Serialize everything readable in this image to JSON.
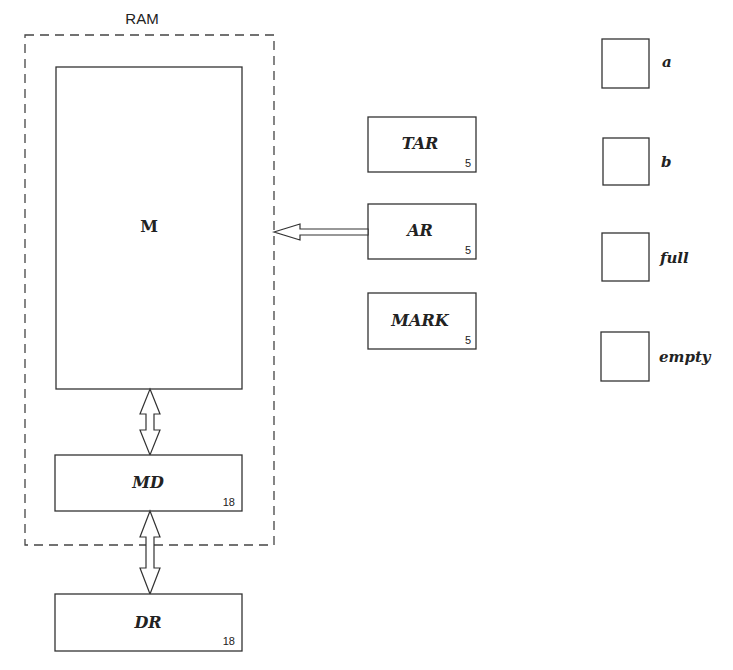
{
  "ram": {
    "title": "RAM",
    "memory": {
      "label": "M"
    },
    "md": {
      "label": "MD",
      "width_bits": "18"
    }
  },
  "dr": {
    "label": "DR",
    "width_bits": "18"
  },
  "registers": [
    {
      "label": "TAR",
      "width_bits": "5"
    },
    {
      "label": "AR",
      "width_bits": "5"
    },
    {
      "label": "MARK",
      "width_bits": "5"
    }
  ],
  "flags": [
    {
      "label": "a"
    },
    {
      "label": "b"
    },
    {
      "label": "full"
    },
    {
      "label": "empty"
    }
  ],
  "colors": {
    "stroke": "#333333",
    "background": "#ffffff"
  }
}
